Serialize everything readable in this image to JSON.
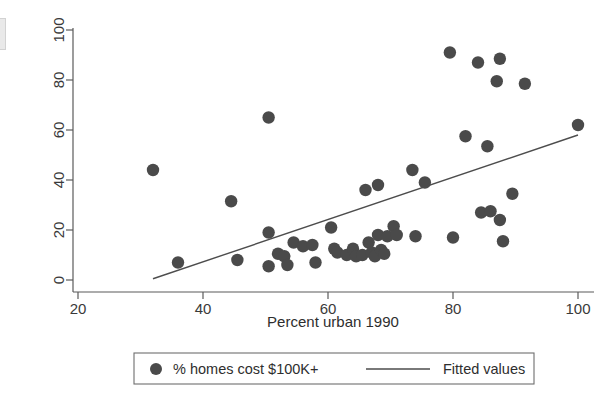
{
  "chart_data": {
    "type": "scatter",
    "title": "",
    "xlabel": "Percent urban 1990",
    "ylabel": "",
    "xlim": [
      20,
      100
    ],
    "ylim": [
      0,
      100
    ],
    "xticks": [
      20,
      40,
      60,
      80,
      100
    ],
    "yticks": [
      0,
      20,
      40,
      60,
      80,
      100
    ],
    "grid": false,
    "marker_color": "#4a4a4a",
    "line_color": "#4d4d4d",
    "legend_position": "below-axis",
    "series": [
      {
        "name": "% homes cost $100K+",
        "type": "scatter",
        "points": [
          [
            32.0,
            44.0
          ],
          [
            36.0,
            7.0
          ],
          [
            44.5,
            31.5
          ],
          [
            45.5,
            8.0
          ],
          [
            50.5,
            65.0
          ],
          [
            50.5,
            19.0
          ],
          [
            50.5,
            5.5
          ],
          [
            52.0,
            10.5
          ],
          [
            53.0,
            9.5
          ],
          [
            53.5,
            6.0
          ],
          [
            54.5,
            15.0
          ],
          [
            56.0,
            13.5
          ],
          [
            57.5,
            14.0
          ],
          [
            58.0,
            7.0
          ],
          [
            60.5,
            21.0
          ],
          [
            61.0,
            12.5
          ],
          [
            61.5,
            11.0
          ],
          [
            63.0,
            10.0
          ],
          [
            64.0,
            12.5
          ],
          [
            64.5,
            9.5
          ],
          [
            65.5,
            10.0
          ],
          [
            66.0,
            36.0
          ],
          [
            66.5,
            15.0
          ],
          [
            67.0,
            11.0
          ],
          [
            67.5,
            9.5
          ],
          [
            68.0,
            38.0
          ],
          [
            68.0,
            18.0
          ],
          [
            68.5,
            12.0
          ],
          [
            69.0,
            10.5
          ],
          [
            69.5,
            17.5
          ],
          [
            70.5,
            21.5
          ],
          [
            71.0,
            18.0
          ],
          [
            73.5,
            44.0
          ],
          [
            74.0,
            17.5
          ],
          [
            75.5,
            39.0
          ],
          [
            79.5,
            91.0
          ],
          [
            80.0,
            17.0
          ],
          [
            82.0,
            57.5
          ],
          [
            84.0,
            87.0
          ],
          [
            84.5,
            27.0
          ],
          [
            85.5,
            53.5
          ],
          [
            86.0,
            27.5
          ],
          [
            87.5,
            88.5
          ],
          [
            87.0,
            79.5
          ],
          [
            87.5,
            24.0
          ],
          [
            88.0,
            15.5
          ],
          [
            89.5,
            34.5
          ],
          [
            91.5,
            78.5
          ],
          [
            100.0,
            62.0
          ]
        ]
      },
      {
        "name": "Fitted values",
        "type": "line",
        "points": [
          [
            32.0,
            0.5
          ],
          [
            100.0,
            58.0
          ]
        ]
      }
    ]
  },
  "axes": {
    "x_title": "Percent urban 1990",
    "x_tick_labels": [
      "20",
      "40",
      "60",
      "80",
      "100"
    ],
    "y_tick_labels": [
      "0",
      "20",
      "40",
      "60",
      "80",
      "100"
    ]
  },
  "legend": {
    "marker_label": "% homes cost $100K+",
    "line_label": "Fitted values"
  }
}
